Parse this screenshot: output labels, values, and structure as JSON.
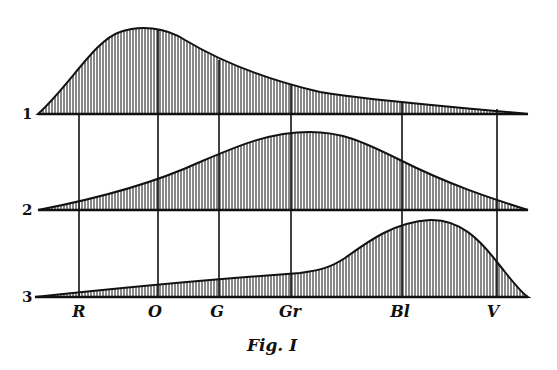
{
  "figure": {
    "caption": "Fig. I",
    "curves": [
      {
        "id": "1",
        "label": "1",
        "baseline_y": 114,
        "peak_band": "O"
      },
      {
        "id": "2",
        "label": "2",
        "baseline_y": 210,
        "peak_band": "Gr"
      },
      {
        "id": "3",
        "label": "3",
        "baseline_y": 297,
        "peak_band": "Bl"
      }
    ],
    "bands": [
      {
        "label": "R",
        "x": 79
      },
      {
        "label": "O",
        "x": 158
      },
      {
        "label": "G",
        "x": 219
      },
      {
        "label": "Gr",
        "x": 291
      },
      {
        "label": "Bl",
        "x": 402
      },
      {
        "label": "V",
        "x": 497
      }
    ],
    "colors": {
      "ink": "#111111",
      "paper": "#ffffff"
    }
  }
}
